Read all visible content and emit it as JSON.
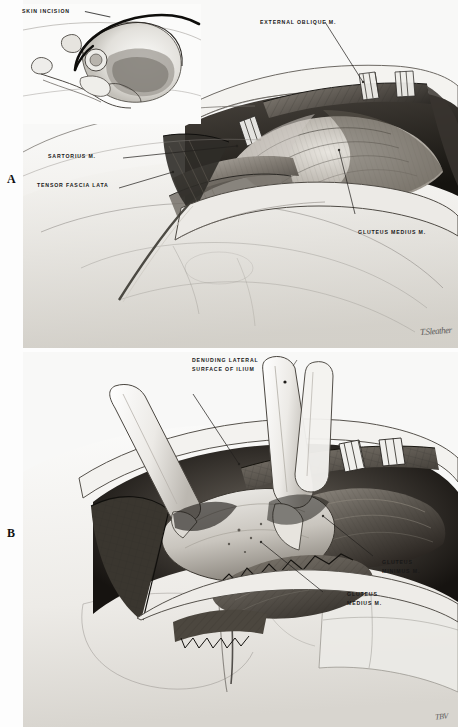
{
  "figure": {
    "type": "medical-surgical-illustration",
    "style": "graphite pencil rendering, grayscale",
    "background_color": "#fdfdfd",
    "ink_color": "#181818",
    "panel_count": 2
  },
  "panels": [
    {
      "letter": "A",
      "caption_position": "left-margin",
      "description": "Anterior iliac exposure: skin incision inset plus superficial dissection exposing external oblique, sartorius, tensor fascia lata and gluteus medius.",
      "inset": {
        "present": true,
        "label": "SKIN INCISION",
        "description": "Lateral pelvis bone outline with curved incision line marked over the iliac crest."
      },
      "labels": [
        {
          "id": "skin-incision",
          "text": "SKIN INCISION",
          "lines": [
            "SKIN INCISION"
          ]
        },
        {
          "id": "external-oblique",
          "text": "EXTERNAL OBLIQUE M.",
          "lines": [
            "EXTERNAL OBLIQUE M."
          ]
        },
        {
          "id": "sartorius",
          "text": "SARTORIUS M.",
          "lines": [
            "SARTORIUS M."
          ]
        },
        {
          "id": "tensor-fascia-lata",
          "text": "TENSOR FASCIA LATA",
          "lines": [
            "TENSOR FASCIA LATA"
          ]
        },
        {
          "id": "gluteus-medius-a",
          "text": "GLUTEUS MEDIUS M.",
          "lines": [
            "GLUTEUS MEDIUS M."
          ]
        }
      ],
      "signature": "T.Sleather"
    },
    {
      "letter": "B",
      "caption_position": "left-margin",
      "description": "Deep exposure: retractors elevate muscle flaps while the lateral surface of the ilium is denuded, showing gluteus medius and gluteus minimus.",
      "labels": [
        {
          "id": "denuding-lateral-surface",
          "text": "DENUDING LATERAL SURFACE OF ILIUM",
          "lines": [
            "DENUDING LATERAL",
            "SURFACE OF ILIUM"
          ]
        },
        {
          "id": "gluteus-minimus",
          "text": "GLUTEUS MINIMUS M.",
          "lines": [
            "GLUTEUS",
            "MINIMUS M."
          ]
        },
        {
          "id": "gluteus-medius-b",
          "text": "GLUTEUS MEDIUS M.",
          "lines": [
            "GLUTEUS",
            "MEDIUS M."
          ]
        }
      ],
      "signature": "TBV"
    }
  ],
  "panel_letters": {
    "a": "A",
    "b": "B"
  },
  "signatures": {
    "panel_a": "T.Sleather",
    "panel_b": "TBV"
  },
  "palette": {
    "paper": "#f7f7f6",
    "skin_light": "#ededea",
    "skin_mid": "#d9d7d2",
    "muscle_dark": "#6f6b65",
    "muscle_deep": "#3b3733",
    "shadow": "#2a2724",
    "ink": "#181818",
    "retractor": "#f2f1ee"
  }
}
